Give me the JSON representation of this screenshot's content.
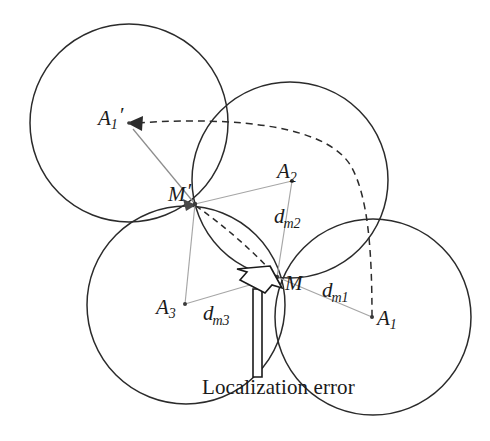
{
  "figure": {
    "caption": "Localization error",
    "background_color": "#ffffff",
    "circle_stroke_color": "#2b2b2b",
    "radius_line_color": "#a6a6a6",
    "dashed_stroke_color": "#2b2b2b"
  },
  "labels": {
    "anchor1_shifted": {
      "base": "A",
      "sub": "1",
      "prime": "′"
    },
    "anchor2": {
      "base": "A",
      "sub": "2"
    },
    "anchor1": {
      "base": "A",
      "sub": "1"
    },
    "anchor3": {
      "base": "A",
      "sub": "3"
    },
    "node_estimated": {
      "base": "M",
      "prime": "′"
    },
    "node_true": {
      "base": "M"
    },
    "dist_m1": {
      "base": "d",
      "sub": "m1"
    },
    "dist_m2": {
      "base": "d",
      "sub": "m2"
    },
    "dist_m3": {
      "base": "d",
      "sub": "m3"
    }
  },
  "geometry": {
    "circles": [
      {
        "name": "circle-anchor1-shifted",
        "cx": 129,
        "cy": 123,
        "r": 99
      },
      {
        "name": "circle-anchor2",
        "cx": 290,
        "cy": 180,
        "r": 98
      },
      {
        "name": "circle-anchor1",
        "cx": 373,
        "cy": 317,
        "r": 98
      },
      {
        "name": "circle-anchor3",
        "cx": 186,
        "cy": 305,
        "r": 99
      }
    ],
    "points": [
      {
        "name": "anchor1-shifted",
        "x": 129,
        "y": 123
      },
      {
        "name": "anchor2",
        "x": 292,
        "y": 181
      },
      {
        "name": "anchor1",
        "x": 372,
        "y": 317
      },
      {
        "name": "anchor3",
        "x": 185,
        "y": 304
      },
      {
        "name": "node-estimated",
        "x": 195,
        "y": 204
      },
      {
        "name": "node-true",
        "x": 277,
        "y": 277
      }
    ]
  }
}
